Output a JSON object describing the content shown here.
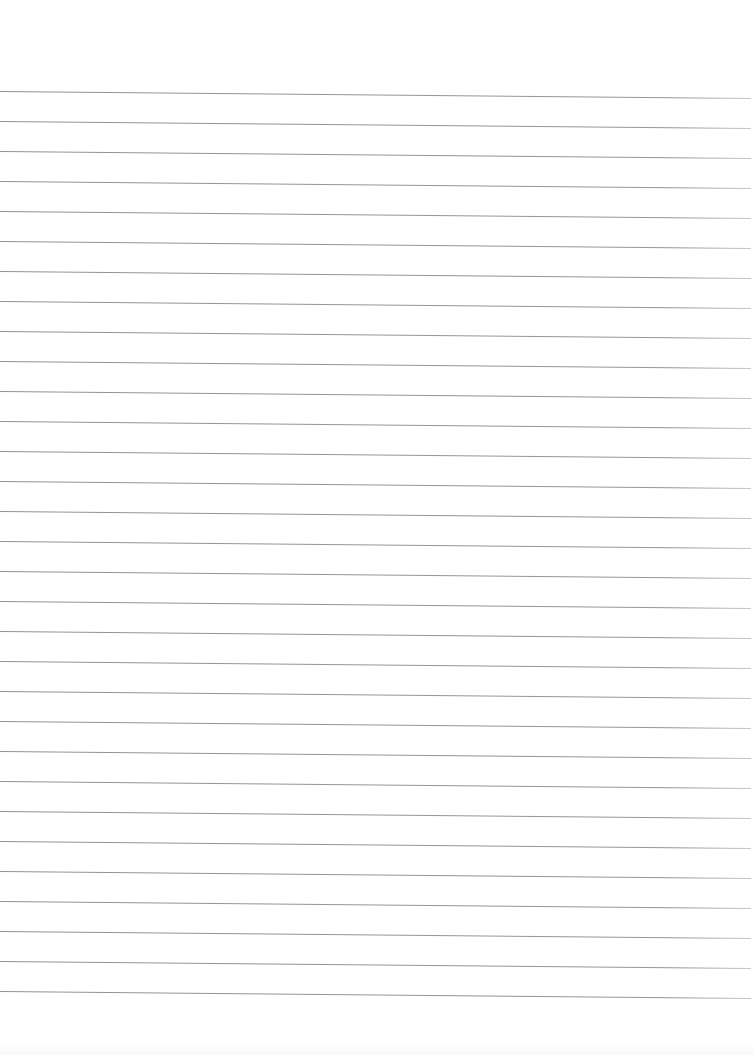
{
  "page": {
    "type": "lined-paper",
    "background_color": "#ffffff",
    "content_text": ""
  },
  "ruling": {
    "line_count": 31,
    "first_line_y_left": 91,
    "first_line_y_right": 98,
    "spacing_px": 30,
    "line_color": "#8a8a8a",
    "line_thickness_px": 1,
    "x_start": 0,
    "x_end": 751
  }
}
